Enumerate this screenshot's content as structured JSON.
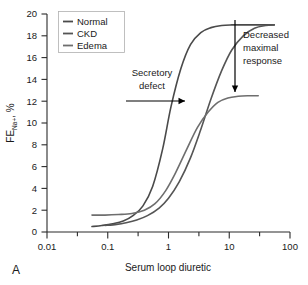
{
  "panel": {
    "label": "A"
  },
  "chart_data": {
    "type": "line",
    "title": "",
    "xlabel": "Serum loop diuretic",
    "ylabel": "FE",
    "ylabel_sub": "Na+",
    "ylabel_unit": ", %",
    "ylabel_full": "FE Na+, %",
    "xscale": "log",
    "xlim": [
      0.01,
      100
    ],
    "ylim": [
      0,
      20
    ],
    "xticks": [
      "0.01",
      "0.1",
      "1",
      "10",
      "100"
    ],
    "xtick_values": [
      0.01,
      0.1,
      1,
      10,
      100
    ],
    "yticks": [
      "0",
      "2",
      "4",
      "6",
      "8",
      "10",
      "12",
      "14",
      "16",
      "18",
      "20"
    ],
    "ytick_values": [
      0,
      2,
      4,
      6,
      8,
      10,
      12,
      14,
      16,
      18,
      20
    ],
    "grid": false,
    "legend_position": "top-left",
    "series": [
      {
        "name": "Normal",
        "color": "#4a4a4a",
        "baseline": 0.5,
        "plateau": 19.0,
        "ec50": 1.1,
        "hill": 2.6,
        "x_start": 0.055,
        "x_end": 55,
        "x": [
          0.055,
          0.08,
          0.12,
          0.18,
          0.26,
          0.38,
          0.55,
          0.8,
          1.1,
          1.6,
          2.3,
          3.4,
          5.0,
          7.5,
          11,
          17,
          26,
          40,
          55
        ],
        "y": [
          0.5,
          0.6,
          0.75,
          1.0,
          1.5,
          2.4,
          4.2,
          7.6,
          11.5,
          15.0,
          17.2,
          18.3,
          18.75,
          18.95,
          19.0,
          19.0,
          19.0,
          19.0,
          19.0
        ]
      },
      {
        "name": "CKD",
        "color": "#555555",
        "baseline": 0.55,
        "plateau": 19.0,
        "ec50": 6.5,
        "hill": 2.2,
        "x_start": 0.09,
        "x_end": 55,
        "x": [
          0.09,
          0.14,
          0.2,
          0.3,
          0.45,
          0.7,
          1.0,
          1.5,
          2.3,
          3.4,
          5.0,
          7.5,
          11,
          17,
          26,
          40,
          55
        ],
        "y": [
          0.6,
          0.7,
          0.85,
          1.1,
          1.5,
          2.2,
          3.1,
          4.6,
          6.8,
          9.4,
          12.2,
          14.8,
          16.7,
          18.0,
          18.7,
          18.95,
          19.0
        ]
      },
      {
        "name": "Edema",
        "color": "#6e6e6e",
        "baseline": 1.55,
        "plateau": 12.5,
        "ec50": 2.6,
        "hill": 2.0,
        "x_start": 0.055,
        "x_end": 30,
        "x": [
          0.055,
          0.09,
          0.15,
          0.25,
          0.4,
          0.6,
          0.9,
          1.3,
          2.0,
          3.0,
          4.5,
          6.5,
          9.5,
          14,
          20,
          30
        ],
        "y": [
          1.55,
          1.55,
          1.6,
          1.7,
          2.0,
          2.6,
          3.8,
          5.4,
          7.6,
          9.6,
          11.0,
          11.9,
          12.3,
          12.45,
          12.5,
          12.5
        ]
      }
    ],
    "annotations": [
      {
        "name": "secretory-defect",
        "line1": "Secretory",
        "line2": "defect",
        "arrow": "right"
      },
      {
        "name": "decreased-maximal-response",
        "line1": "Decreased",
        "line2": "maximal",
        "line3": "response",
        "arrow": "down"
      }
    ]
  }
}
